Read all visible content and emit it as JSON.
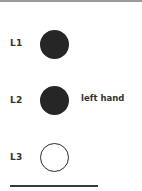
{
  "rows": [
    {
      "label": "L1",
      "state": "filled",
      "annotation": ""
    },
    {
      "label": "L2",
      "state": "filled",
      "annotation": "left hand"
    },
    {
      "label": "L3",
      "state": "empty",
      "annotation": ""
    }
  ],
  "colors": {
    "filled": "#262626",
    "outline": "#2a2a2a",
    "text": "#333333",
    "topbar": "#9a9a9a"
  }
}
